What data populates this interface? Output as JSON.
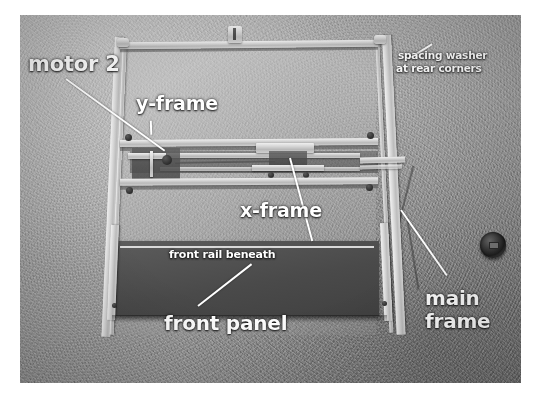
{
  "image": {
    "kind": "photograph",
    "subject": "XY plotter / CNC machine frame viewed from the front, mounted against a textured wall",
    "palette": {
      "wall": "#9e9e9e",
      "metal_rail": "#d8d8d8",
      "front_panel": "#555555",
      "label_text": "#ffffff",
      "knob": "#2a2a2a"
    }
  },
  "annotations": [
    {
      "id": "motor-2",
      "text": "motor 2",
      "size": 21,
      "has_leader": true
    },
    {
      "id": "y-frame",
      "text": "y-frame",
      "size": 19,
      "has_leader": true
    },
    {
      "id": "x-frame",
      "text": "x-frame",
      "size": 19,
      "has_leader": true
    },
    {
      "id": "front-panel",
      "text": "front panel",
      "size": 20,
      "has_leader": true
    },
    {
      "id": "main-frame-line-1",
      "text": "main",
      "size": 20,
      "has_leader": true
    },
    {
      "id": "main-frame-line-2",
      "text": "frame",
      "size": 20,
      "has_leader": false
    },
    {
      "id": "front-rail-beneath",
      "text": "front rail beneath",
      "size": 11,
      "has_leader": false
    },
    {
      "id": "spacing-washer-1",
      "text": "spacing washer",
      "size": 10,
      "has_leader": true
    },
    {
      "id": "spacing-washer-2",
      "text": "at rear corners",
      "size": 10,
      "has_leader": false
    }
  ]
}
